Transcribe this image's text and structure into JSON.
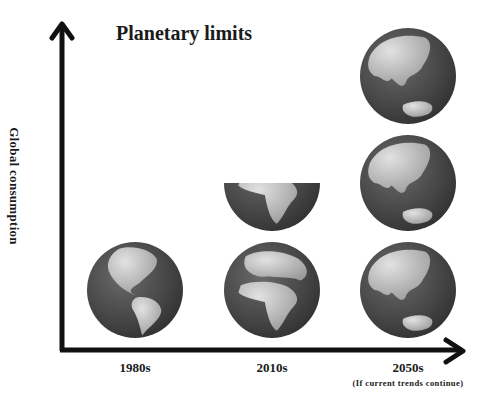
{
  "diagram": {
    "title": "Planetary limits",
    "y_axis_label": "Global consumption",
    "columns": [
      {
        "label": "1980s",
        "note": "",
        "earths": 1,
        "view": "americas"
      },
      {
        "label": "2010s",
        "note": "",
        "earths": 1.5,
        "view": "africa-europe"
      },
      {
        "label": "2050s",
        "note": "(If current trends continue)",
        "earths": 3,
        "view": "asia-australia"
      }
    ],
    "colors": {
      "axis": "#111111",
      "ocean": "#4a4a4a",
      "land": "#c8c8c8",
      "text": "#1a1a1a"
    }
  }
}
